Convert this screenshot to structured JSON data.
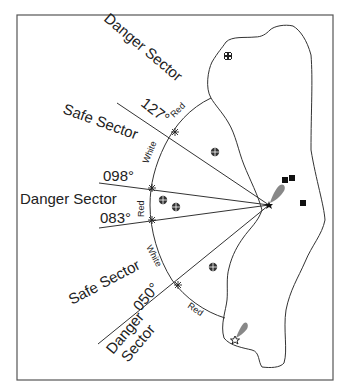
{
  "diagram": {
    "colors": {
      "line": "#333333",
      "flare": "#888888",
      "frame": "#555555",
      "text": "#222222"
    },
    "sector_labels": {
      "danger_top": "Danger Sector",
      "safe_upper": "Safe Sector",
      "danger_middle": "Danger Sector",
      "safe_lower": "Safe Sector",
      "danger_bottom_line1": "Danger",
      "danger_bottom_line2": "Sector"
    },
    "bearings": {
      "b127": "127°",
      "b098": "098°",
      "b083": "083°",
      "b050": "050°"
    },
    "light_colors": {
      "top": "Red",
      "upper": "White",
      "middle": "Red",
      "lower": "White",
      "bottom": "Red"
    },
    "symbols": {
      "light": "lighthouse-star-icon",
      "rock": "rock-hazard-icon",
      "building": "building-square-icon",
      "church": "church-cross-icon",
      "secondary_light": "secondary-light-star-icon"
    }
  }
}
